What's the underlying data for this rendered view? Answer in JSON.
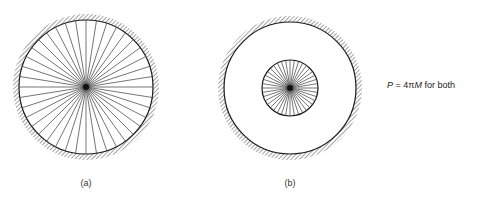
{
  "figure": {
    "line_color": "#1a1a1a",
    "hatch_color": "#555555",
    "panels": [
      {
        "id": "a",
        "label": "(a)",
        "center": [
          86,
          87
        ],
        "wall_radius": 67,
        "charge_region_radius": 67,
        "radial_line_count": 40,
        "label_pos": [
          86,
          184
        ]
      },
      {
        "id": "b",
        "label": "(b)",
        "center": [
          290,
          88
        ],
        "wall_radius": 66,
        "charge_region_radius": 28,
        "radial_line_count": 40,
        "label_pos": [
          290,
          184
        ]
      }
    ]
  },
  "equation": {
    "lhs": "P",
    "equals": " = 4π",
    "rhs_var": "M",
    "suffix": " for both"
  }
}
